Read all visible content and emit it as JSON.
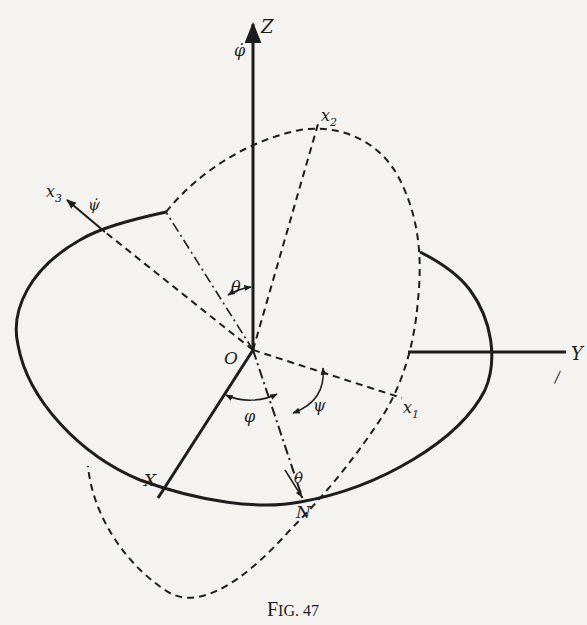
{
  "figure": {
    "caption": "FIG. 47",
    "caption_first": "F",
    "caption_rest": "IG. 47"
  },
  "labels": {
    "Z": "Z",
    "phi_dot": "φ̇",
    "Y": "Y",
    "X": "X",
    "O": "O",
    "N": "N",
    "x1": "x",
    "x1_sub": "1",
    "x2": "x",
    "x2_sub": "2",
    "x3": "x",
    "x3_sub": "3",
    "psi_dot": "ψ̇",
    "theta": "θ",
    "phi": "φ",
    "psi": "ψ",
    "theta_dot": "θ̇",
    "stray_mark": "/"
  },
  "colors": {
    "ink": "#1d1d1d",
    "paper": "#f4f3ef"
  }
}
